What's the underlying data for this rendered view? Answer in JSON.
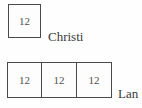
{
  "figure_top": {
    "cells": [
      "12"
    ],
    "label": "Christi"
  },
  "figure_bottom": {
    "cells": [
      "12",
      "12",
      "12"
    ],
    "label": "Lan"
  },
  "colors": {
    "line": "#4a4a4a",
    "number_text": "#515151",
    "label_text": "#3a3a3a",
    "background": "#fefefe"
  }
}
